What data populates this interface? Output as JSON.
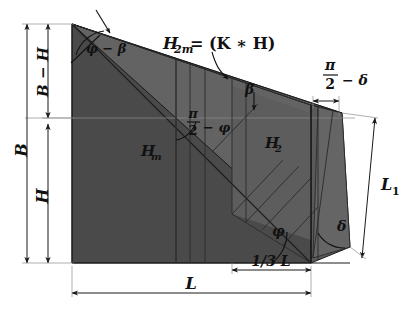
{
  "figure": {
    "kind": "engineering-geometry-diagram",
    "background_color": "#ffffff"
  },
  "colors": {
    "fill_dark": "#4a4a4a",
    "fill_mid": "#565656",
    "fill_light": "#636363",
    "fill_lighter": "#6d6d6d",
    "outline": "#1d1d1d",
    "dimension": "#1a1a1a",
    "thin_guide": "#8d8d8d",
    "text": "#111111"
  },
  "labels": {
    "b_total": "B",
    "b_minus_h": "B − H",
    "h": "H",
    "phi_minus_beta": "φ − β",
    "h2m_expression": "H₂ₘ = (K ∗ H)",
    "h2m_symbol": "H",
    "h2m_sub": "2m",
    "h2m_rhs": "= (K ∗ H)",
    "beta": "β",
    "hm_symbol": "H",
    "hm_sub": "m",
    "h2_symbol": "H",
    "h2_sub": "2",
    "pi": "π",
    "two": "2",
    "minus_phi": "− φ",
    "minus_delta": "− δ",
    "phi": "φ",
    "delta": "δ",
    "l1_symbol": "L",
    "l1_sub": "1",
    "one_third_l": "1/3 L",
    "l": "L"
  },
  "dimensions": {
    "left": [
      {
        "name": "B",
        "text": "B",
        "note": "full left height, outermost"
      },
      {
        "name": "B-H",
        "text": "B − H",
        "note": "upper segment, inner"
      },
      {
        "name": "H",
        "text": "H",
        "note": "lower segment, inner"
      }
    ],
    "bottom": [
      {
        "name": "L",
        "text": "L",
        "note": "full base width"
      },
      {
        "name": "1/3L",
        "text": "1/3 L",
        "note": "right third of base"
      }
    ],
    "right": [
      {
        "name": "L1",
        "text": "L₁",
        "note": "inclined right side length"
      }
    ]
  },
  "angles": [
    {
      "name": "phi-minus-beta",
      "text": "φ − β",
      "location": "top-left crest"
    },
    {
      "name": "beta",
      "text": "β",
      "location": "upper-middle, arrow to slope"
    },
    {
      "name": "pi-over-2-minus-phi",
      "text": "π/2 − φ",
      "location": "mid-left of wedge"
    },
    {
      "name": "pi-over-2-minus-delta",
      "text": "π/2 − δ",
      "location": "top-right"
    },
    {
      "name": "phi",
      "text": "φ",
      "location": "bottom-middle-right vertex"
    },
    {
      "name": "delta",
      "text": "δ",
      "location": "bottom-right vertex"
    }
  ],
  "interior_labels": [
    {
      "name": "Hm",
      "text": "Hₘ"
    },
    {
      "name": "H2",
      "text": "H₂"
    },
    {
      "name": "H2m",
      "text": "H₂ₘ = (K ∗ H)"
    }
  ]
}
